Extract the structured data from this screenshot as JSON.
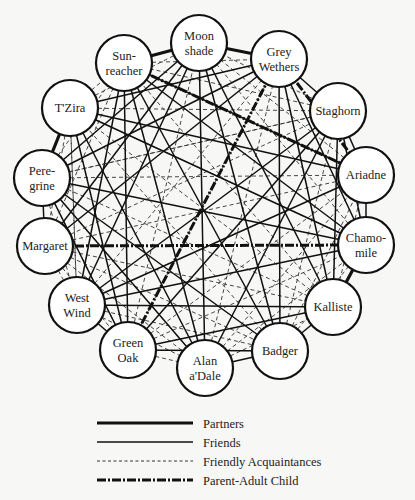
{
  "diagram": {
    "title": "",
    "nodes": [
      {
        "id": "moonshade",
        "lines": [
          "Moon",
          "shade"
        ],
        "x": 199,
        "y": 43
      },
      {
        "id": "sunreacher",
        "lines": [
          "Sun-",
          "reacher"
        ],
        "x": 124,
        "y": 63
      },
      {
        "id": "greywethers",
        "lines": [
          "Grey",
          "Wethers"
        ],
        "x": 279,
        "y": 59
      },
      {
        "id": "tzira",
        "lines": [
          "T'Zira"
        ],
        "x": 70,
        "y": 108
      },
      {
        "id": "staghorn",
        "lines": [
          "Staghorn"
        ],
        "x": 338,
        "y": 111
      },
      {
        "id": "peregrine",
        "lines": [
          "Pere-",
          "grine"
        ],
        "x": 42,
        "y": 178
      },
      {
        "id": "ariadne",
        "lines": [
          "Ariadne"
        ],
        "x": 366,
        "y": 175
      },
      {
        "id": "margaret",
        "lines": [
          "Margaret"
        ],
        "x": 45,
        "y": 246
      },
      {
        "id": "chamomile",
        "lines": [
          "Chamo-",
          "mile"
        ],
        "x": 366,
        "y": 245
      },
      {
        "id": "westwind",
        "lines": [
          "West",
          "Wind"
        ],
        "x": 77,
        "y": 305
      },
      {
        "id": "kalliste",
        "lines": [
          "Kalliste"
        ],
        "x": 333,
        "y": 307
      },
      {
        "id": "greenoak",
        "lines": [
          "Green",
          "Oak"
        ],
        "x": 128,
        "y": 350
      },
      {
        "id": "alanadale",
        "lines": [
          "Alan",
          "a'Dale"
        ],
        "x": 205,
        "y": 368
      },
      {
        "id": "badger",
        "lines": [
          "Badger"
        ],
        "x": 280,
        "y": 351
      }
    ],
    "node_radius": 28,
    "edges": {
      "partners": [
        [
          "sunreacher",
          "moonshade"
        ],
        [
          "tzira",
          "peregrine"
        ],
        [
          "chamomile",
          "kalliste"
        ],
        [
          "moonshade",
          "greywethers"
        ]
      ],
      "friends": [
        [
          "moonshade",
          "greywethers"
        ],
        [
          "greywethers",
          "staghorn"
        ],
        [
          "staghorn",
          "ariadne"
        ],
        [
          "ariadne",
          "chamomile"
        ],
        [
          "margaret",
          "peregrine"
        ],
        [
          "westwind",
          "greenoak"
        ],
        [
          "alanadale",
          "badger"
        ],
        [
          "badger",
          "kalliste"
        ],
        [
          "tzira",
          "chamomile"
        ],
        [
          "tzira",
          "ariadne"
        ],
        [
          "tzira",
          "alanadale"
        ],
        [
          "tzira",
          "greenoak"
        ],
        [
          "tzira",
          "greywethers"
        ],
        [
          "peregrine",
          "greywethers"
        ],
        [
          "peregrine",
          "moonshade"
        ],
        [
          "peregrine",
          "chamomile"
        ],
        [
          "peregrine",
          "badger"
        ],
        [
          "peregrine",
          "alanadale"
        ],
        [
          "peregrine",
          "greenoak"
        ],
        [
          "margaret",
          "greywethers"
        ],
        [
          "margaret",
          "moonshade"
        ],
        [
          "westwind",
          "ariadne"
        ],
        [
          "westwind",
          "kalliste"
        ],
        [
          "westwind",
          "chamomile"
        ],
        [
          "westwind",
          "sunreacher"
        ],
        [
          "westwind",
          "moonshade"
        ],
        [
          "greenoak",
          "kalliste"
        ],
        [
          "greenoak",
          "badger"
        ],
        [
          "greenoak",
          "staghorn"
        ],
        [
          "greenoak",
          "sunreacher"
        ],
        [
          "alanadale",
          "moonshade"
        ],
        [
          "alanadale",
          "staghorn"
        ],
        [
          "alanadale",
          "sunreacher"
        ],
        [
          "badger",
          "moonshade"
        ],
        [
          "badger",
          "sunreacher"
        ],
        [
          "badger",
          "greywethers"
        ],
        [
          "kalliste",
          "greywethers"
        ],
        [
          "kalliste",
          "moonshade"
        ],
        [
          "chamomile",
          "sunreacher"
        ],
        [
          "chamomile",
          "greywethers"
        ],
        [
          "ariadne",
          "sunreacher"
        ],
        [
          "staghorn",
          "westwind"
        ],
        [
          "staghorn",
          "kalliste"
        ],
        [
          "staghorn",
          "chamomile"
        ]
      ],
      "acquaintances": [
        [
          "tzira",
          "staghorn"
        ],
        [
          "peregrine",
          "ariadne"
        ],
        [
          "tzira",
          "sunreacher"
        ],
        [
          "greenoak",
          "alanadale"
        ],
        [
          "margaret",
          "westwind"
        ],
        [
          "sunreacher",
          "greywethers"
        ],
        [
          "tzira",
          "westwind"
        ],
        [
          "peregrine",
          "kalliste"
        ],
        [
          "margaret",
          "badger"
        ],
        [
          "margaret",
          "kalliste"
        ],
        [
          "margaret",
          "staghorn"
        ],
        [
          "margaret",
          "sunreacher"
        ],
        [
          "westwind",
          "alanadale"
        ],
        [
          "westwind",
          "badger"
        ],
        [
          "westwind",
          "greywethers"
        ],
        [
          "greenoak",
          "chamomile"
        ],
        [
          "greenoak",
          "ariadne"
        ],
        [
          "greenoak",
          "greywethers"
        ],
        [
          "greenoak",
          "moonshade"
        ],
        [
          "alanadale",
          "greywethers"
        ],
        [
          "alanadale",
          "ariadne"
        ],
        [
          "alanadale",
          "chamomile"
        ],
        [
          "alanadale",
          "kalliste"
        ],
        [
          "badger",
          "ariadne"
        ],
        [
          "badger",
          "staghorn"
        ],
        [
          "badger",
          "chamomile"
        ],
        [
          "kalliste",
          "ariadne"
        ],
        [
          "kalliste",
          "sunreacher"
        ],
        [
          "kalliste",
          "tzira"
        ],
        [
          "chamomile",
          "moonshade"
        ],
        [
          "ariadne",
          "moonshade"
        ],
        [
          "staghorn",
          "moonshade"
        ],
        [
          "staghorn",
          "sunreacher"
        ],
        [
          "staghorn",
          "peregrine"
        ],
        [
          "tzira",
          "moonshade"
        ],
        [
          "tzira",
          "margaret"
        ],
        [
          "peregrine",
          "sunreacher"
        ],
        [
          "peregrine",
          "westwind"
        ],
        [
          "margaret",
          "greenoak"
        ],
        [
          "margaret",
          "alanadale"
        ],
        [
          "margaret",
          "ariadne"
        ],
        [
          "chamomile",
          "tzira"
        ],
        [
          "peregrine",
          "staghorn"
        ],
        [
          "westwind",
          "tzira"
        ],
        [
          "greenoak",
          "peregrine"
        ],
        [
          "badger",
          "tzira"
        ],
        [
          "alanadale",
          "peregrine"
        ]
      ],
      "parent_child": [
        [
          "margaret",
          "chamomile"
        ],
        [
          "sunreacher",
          "ariadne"
        ],
        [
          "greywethers",
          "ariadne"
        ],
        [
          "greenoak",
          "greywethers"
        ]
      ]
    }
  },
  "legend": {
    "items": [
      {
        "key": "partners",
        "label": "Partners"
      },
      {
        "key": "friends",
        "label": "Friends"
      },
      {
        "key": "acquaintances",
        "label": "Friendly Acquaintances"
      },
      {
        "key": "parent_child",
        "label": "Parent-Adult Child"
      }
    ]
  },
  "styles": {
    "line_color": "#111111",
    "node_fill": "#ffffff",
    "background": "#f7f7f5"
  }
}
